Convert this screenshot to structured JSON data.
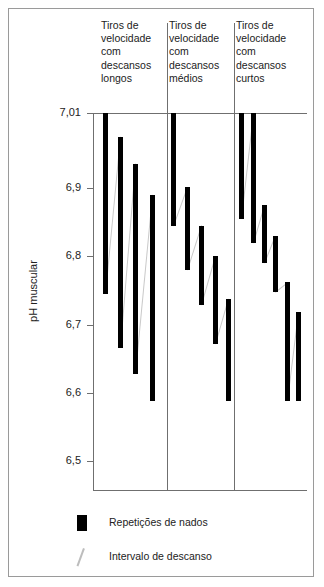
{
  "chart_data": {
    "type": "bar",
    "title": "",
    "xlabel": "",
    "ylabel": "pH muscular",
    "ylim": [
      6.5,
      7.01
    ],
    "ytick_labels": [
      "7,01",
      "6,9",
      "6,8",
      "6,7",
      "6,6",
      "6,5"
    ],
    "ytick_values": [
      7.01,
      6.9,
      6.8,
      6.7,
      6.6,
      6.5
    ],
    "grid": false,
    "legend_position": "below-plot",
    "legend": [
      {
        "key": "repeticoes",
        "label": "Repetições de nados",
        "marker": "black-bar"
      },
      {
        "key": "intervalo",
        "label": "Intervalo de descanso",
        "marker": "grey-diagonal-line"
      }
    ],
    "groups": [
      {
        "id": "longos",
        "label": "Tiros de velocidade com descansos longos",
        "bars": [
          {
            "top": 7.01,
            "bottom": 6.745
          },
          {
            "top": 6.975,
            "bottom": 6.665
          },
          {
            "top": 6.935,
            "bottom": 6.628
          },
          {
            "top": 6.89,
            "bottom": 6.588
          }
        ]
      },
      {
        "id": "medios",
        "label": "Tiros de velocidade com descansos médios",
        "bars": [
          {
            "top": 7.01,
            "bottom": 6.845
          },
          {
            "top": 6.902,
            "bottom": 6.78
          },
          {
            "top": 6.845,
            "bottom": 6.728
          },
          {
            "top": 6.8,
            "bottom": 6.672
          },
          {
            "top": 6.738,
            "bottom": 6.588
          }
        ]
      },
      {
        "id": "curtos",
        "label": "Tiros de velocidade com descansos curtos",
        "bars": [
          {
            "top": 7.01,
            "bottom": 6.855
          },
          {
            "top": 7.01,
            "bottom": 6.82
          },
          {
            "top": 6.875,
            "bottom": 6.79
          },
          {
            "top": 6.83,
            "bottom": 6.748
          },
          {
            "top": 6.762,
            "bottom": 6.588
          },
          {
            "top": 6.718,
            "bottom": 6.588
          }
        ]
      }
    ]
  }
}
